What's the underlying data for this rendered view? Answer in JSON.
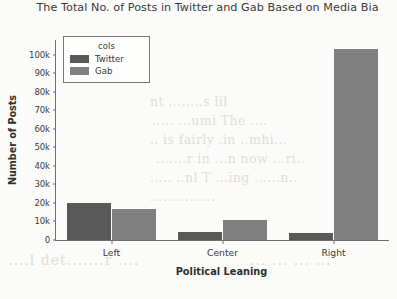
{
  "chart_data": {
    "type": "bar",
    "title": "The Total No. of Posts in Twitter and Gab Based on Media Bia",
    "title_full_visible": "The Total No. of Posts in Twitter and Gab Based on Media Bia",
    "xlabel": "Political Leaning",
    "ylabel": "Number of Posts",
    "categories": [
      "Left",
      "Center",
      "Right"
    ],
    "series": [
      {
        "name": "Twitter",
        "color": "#595959",
        "values": [
          20000,
          4200,
          3600
        ]
      },
      {
        "name": "Gab",
        "color": "#808080",
        "values": [
          17000,
          11000,
          103000
        ]
      }
    ],
    "ylim": [
      0,
      108000
    ],
    "yticks": [
      0,
      10000,
      20000,
      30000,
      40000,
      50000,
      60000,
      70000,
      80000,
      90000,
      100000
    ],
    "ytick_labels": [
      "0",
      "10k",
      "20k",
      "30k",
      "40k",
      "50k",
      "60k",
      "70k",
      "80k",
      "90k",
      "100k"
    ],
    "grid": false,
    "legend": {
      "title": "cols",
      "position": "upper-left",
      "entries": [
        {
          "label": "Twitter",
          "color": "#595959"
        },
        {
          "label": "Gab",
          "color": "#808080"
        }
      ]
    }
  },
  "background_text": {
    "line1": "nt ........s lil",
    "line2": "..... ...umi  The ....",
    "line3": "..  is  fairly .in  ..mhi...",
    "line4": ".......r in ...n  now  ...ri..",
    "line5": "..... ..nl  T  ...ing ......n..",
    "line6": "...............",
    "line7": "....l  det.......r   ....",
    "line8": "... ...   ... ..."
  }
}
